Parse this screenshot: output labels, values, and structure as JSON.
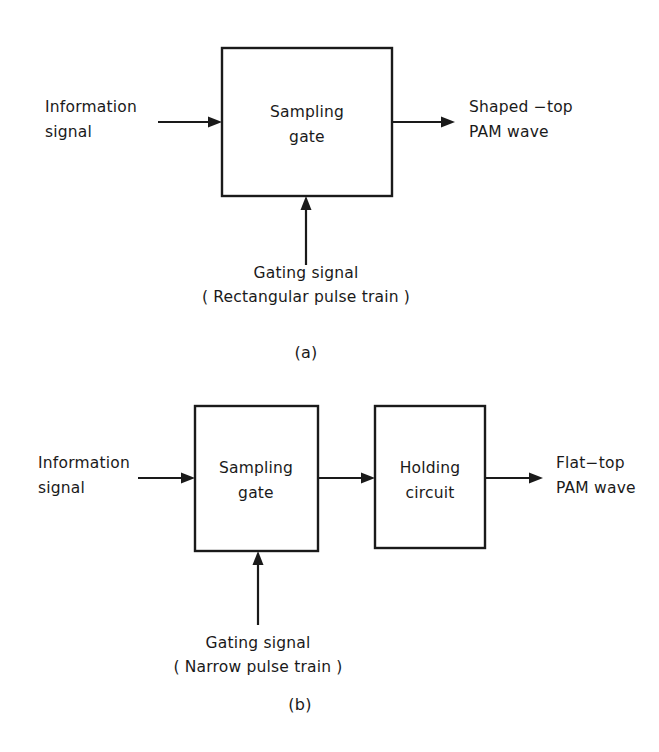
{
  "figure": {
    "background_color": "#ffffff",
    "ink_color": "#1a1a1a",
    "panels": [
      {
        "letter": "(a)",
        "blocks": [
          {
            "line1": "Sampling",
            "line2": "gate"
          }
        ],
        "input_label": {
          "line1": "Information",
          "line2": "signal"
        },
        "output_label": {
          "line1": "Shaped −top",
          "line2": "PAM wave"
        },
        "gating_label": {
          "line1": "Gating signal",
          "line2": "( Rectangular pulse train )"
        }
      },
      {
        "letter": "(b)",
        "blocks": [
          {
            "line1": "Sampling",
            "line2": "gate"
          },
          {
            "line1": "Holding",
            "line2": "circuit"
          }
        ],
        "input_label": {
          "line1": "Information",
          "line2": "signal"
        },
        "output_label": {
          "line1": "Flat−top",
          "line2": "PAM wave"
        },
        "gating_label": {
          "line1": "Gating signal",
          "line2": "( Narrow pulse train )"
        }
      }
    ]
  }
}
